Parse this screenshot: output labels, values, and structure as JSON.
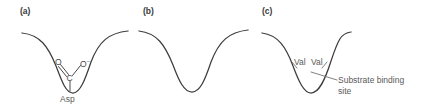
{
  "figure": {
    "type": "diagram",
    "stroke_color": "#3c3c3c",
    "text_color": "#5a5a5a",
    "background_color": "#ffffff"
  },
  "panels": [
    {
      "id": "a",
      "label": "(a)",
      "pocket_shape": "deep wide well",
      "residue_label": "Asp",
      "chem": {
        "oxygen_left": "O",
        "carbon": "C",
        "oxygen_right": "O",
        "oxygen_right_charge": "–"
      }
    },
    {
      "id": "b",
      "label": "(b)",
      "pocket_shape": "deep wide well, unlabeled"
    },
    {
      "id": "c",
      "label": "(c)",
      "pocket_shape": "narrow shallow well",
      "residue_label_left": "Val",
      "residue_label_right": "Val",
      "annotation_line1": "Substrate binding",
      "annotation_line2": "site"
    }
  ]
}
